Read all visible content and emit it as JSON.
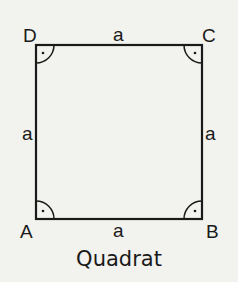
{
  "figure": {
    "caption": "Quadrat",
    "vertices": {
      "A": "A",
      "B": "B",
      "C": "C",
      "D": "D"
    },
    "sides": {
      "top": "a",
      "bottom": "a",
      "left": "a",
      "right": "a"
    },
    "right_angle_marker": "·",
    "colors": {
      "background": "#f2f2ee",
      "stroke": "#1a1a1a"
    }
  }
}
